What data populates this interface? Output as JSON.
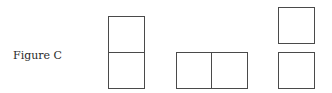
{
  "figure": {
    "label": "Figure C",
    "stroke_color": "#4a4a4a",
    "shapes": [
      {
        "name": "vertical-domino",
        "orientation": "vertical",
        "squares": 2
      },
      {
        "name": "horizontal-domino",
        "orientation": "horizontal",
        "squares": 2
      },
      {
        "name": "separated-squares",
        "orientation": "vertical-separated",
        "squares": 2
      }
    ]
  }
}
